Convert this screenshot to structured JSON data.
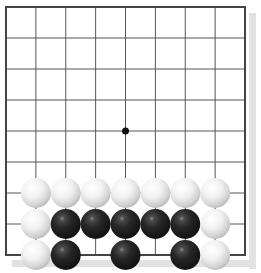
{
  "board": {
    "size": 9,
    "origin_x": 6,
    "origin_y": 7,
    "spacing_x": 29.875,
    "spacing_y": 31,
    "stone_radius": 15,
    "line_color": "#555555",
    "border_color": "#444444",
    "background": "#ffffff",
    "shadow_color": "#e2e2e2",
    "star_points": [
      {
        "col": 4,
        "row": 4
      }
    ]
  },
  "stones": [
    {
      "color": "white",
      "col": 1,
      "row": 6
    },
    {
      "color": "white",
      "col": 2,
      "row": 6
    },
    {
      "color": "white",
      "col": 3,
      "row": 6
    },
    {
      "color": "white",
      "col": 4,
      "row": 6
    },
    {
      "color": "white",
      "col": 5,
      "row": 6
    },
    {
      "color": "white",
      "col": 6,
      "row": 6
    },
    {
      "color": "white",
      "col": 7,
      "row": 6
    },
    {
      "color": "white",
      "col": 1,
      "row": 7
    },
    {
      "color": "black",
      "col": 2,
      "row": 7
    },
    {
      "color": "black",
      "col": 3,
      "row": 7
    },
    {
      "color": "black",
      "col": 4,
      "row": 7
    },
    {
      "color": "black",
      "col": 5,
      "row": 7
    },
    {
      "color": "black",
      "col": 6,
      "row": 7
    },
    {
      "color": "white",
      "col": 7,
      "row": 7
    },
    {
      "color": "white",
      "col": 1,
      "row": 8
    },
    {
      "color": "black",
      "col": 2,
      "row": 8
    },
    {
      "color": "black",
      "col": 4,
      "row": 8
    },
    {
      "color": "black",
      "col": 6,
      "row": 8
    },
    {
      "color": "white",
      "col": 7,
      "row": 8
    }
  ]
}
